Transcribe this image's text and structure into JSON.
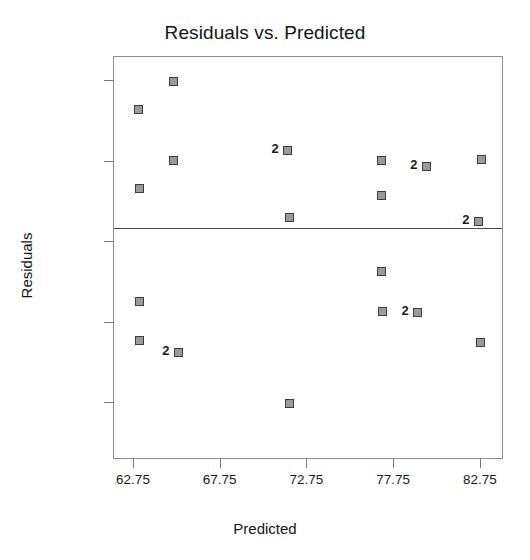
{
  "chart_data": {
    "type": "scatter",
    "title": "Residuals vs. Predicted",
    "xlabel": "Predicted",
    "ylabel": "Residuals",
    "xticks": [
      62.75,
      67.75,
      72.75,
      77.75,
      82.75
    ],
    "xtick_labels": [
      "62.75",
      "67.75",
      "72.75",
      "77.75",
      "82.75"
    ],
    "yticks": [
      4,
      1.8125,
      -0.375,
      -2.5625,
      -4.75
    ],
    "ytick_labels": [
      "4",
      "1.8125",
      "-0.375",
      "-2.5625",
      "-4.75"
    ],
    "xlim": [
      61.6,
      64.1
    ],
    "xlim_actual": [
      61.6,
      84.1
    ],
    "ylim": [
      -5.45,
      5.0
    ],
    "grid": false,
    "legend": null,
    "reference_line": {
      "orientation": "horizontal",
      "y": 0.0
    },
    "marker": {
      "shape": "square",
      "fill": "#9a9a9a",
      "edge": "#3d3d3d"
    },
    "points": [
      {
        "x": 65.0,
        "y": 4.0,
        "count": 1,
        "label": ""
      },
      {
        "x": 63.0,
        "y": 3.22,
        "count": 1,
        "label": ""
      },
      {
        "x": 65.0,
        "y": 1.84,
        "count": 1,
        "label": ""
      },
      {
        "x": 63.05,
        "y": 1.08,
        "count": 1,
        "label": ""
      },
      {
        "x": 71.6,
        "y": 2.1,
        "count": 2,
        "label": "2"
      },
      {
        "x": 77.0,
        "y": 1.85,
        "count": 1,
        "label": ""
      },
      {
        "x": 79.6,
        "y": 1.67,
        "count": 2,
        "label": "2"
      },
      {
        "x": 82.8,
        "y": 1.86,
        "count": 1,
        "label": ""
      },
      {
        "x": 77.05,
        "y": 0.88,
        "count": 1,
        "label": ""
      },
      {
        "x": 71.7,
        "y": 0.3,
        "count": 1,
        "label": ""
      },
      {
        "x": 82.6,
        "y": 0.17,
        "count": 2,
        "label": "2"
      },
      {
        "x": 77.05,
        "y": -1.19,
        "count": 1,
        "label": ""
      },
      {
        "x": 63.05,
        "y": -1.99,
        "count": 1,
        "label": ""
      },
      {
        "x": 77.1,
        "y": -2.25,
        "count": 1,
        "label": ""
      },
      {
        "x": 79.1,
        "y": -2.3,
        "count": 2,
        "label": "2"
      },
      {
        "x": 63.05,
        "y": -3.04,
        "count": 1,
        "label": ""
      },
      {
        "x": 65.3,
        "y": -3.39,
        "count": 2,
        "label": "2"
      },
      {
        "x": 82.75,
        "y": -3.11,
        "count": 1,
        "label": ""
      },
      {
        "x": 71.7,
        "y": -4.75,
        "count": 1,
        "label": ""
      }
    ]
  }
}
